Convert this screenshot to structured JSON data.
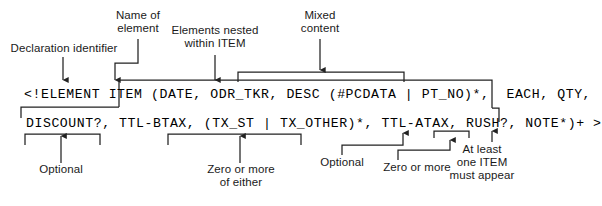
{
  "figure": {
    "type": "annotated-dtd-declaration-diagram",
    "code_lines": [
      "<!ELEMENT ITEM (DATE, ODR_TKR, DESC (#PCDATA | PT_NO)*,  EACH, QTY,",
      "DISCOUNT?, TTL-BTAX, (TX_ST | TX_OTHER)*, TTL-ATAX, RUSH?, NOTE*)+ >"
    ],
    "annotations": {
      "declaration_identifier": "Declaration identifier",
      "name_of_element": "Name of\nelement",
      "elements_nested": "Elements nested\nwithin ITEM",
      "mixed_content": "Mixed\ncontent",
      "optional_left": "Optional",
      "zero_or_more_of_either": "Zero or more\nof either",
      "optional_right": "Optional",
      "zero_or_more_right": "Zero or more",
      "at_least_one": "At least\none ITEM\nmust appear"
    },
    "colors": {
      "background": "#ffffff",
      "text": "#000000",
      "annotation_text": "#1a1a1a",
      "rule": "#222222"
    }
  }
}
